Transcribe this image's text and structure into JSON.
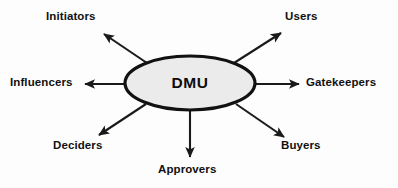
{
  "diagram": {
    "title": "DMU",
    "center": {
      "id": "dmu",
      "label": "DMU",
      "shape": "ellipse",
      "fill": "#ebebeb",
      "stroke": "#111111",
      "stroke_width": 3,
      "cx": 190,
      "cy": 83,
      "rx": 65,
      "ry": 27
    },
    "arrow_color": "#1a1a1a",
    "background": "#fdfdfd",
    "text_color": "#111111",
    "nodes": [
      {
        "id": "initiators",
        "label": "Initiators",
        "direction": "up-left",
        "line": {
          "x1": 147,
          "y1": 63,
          "x2": 104,
          "y2": 34
        }
      },
      {
        "id": "users",
        "label": "Users",
        "direction": "up-right",
        "line": {
          "x1": 234,
          "y1": 63,
          "x2": 281,
          "y2": 33
        }
      },
      {
        "id": "influencers",
        "label": "Influencers",
        "direction": "left",
        "line": {
          "x1": 126,
          "y1": 84,
          "x2": 85,
          "y2": 84
        }
      },
      {
        "id": "gatekeepers",
        "label": "Gatekeepers",
        "direction": "right",
        "line": {
          "x1": 256,
          "y1": 84,
          "x2": 299,
          "y2": 84
        }
      },
      {
        "id": "deciders",
        "label": "Deciders",
        "direction": "down-left",
        "line": {
          "x1": 146,
          "y1": 104,
          "x2": 99,
          "y2": 135
        }
      },
      {
        "id": "buyers",
        "label": "Buyers",
        "direction": "down-right",
        "line": {
          "x1": 236,
          "y1": 104,
          "x2": 284,
          "y2": 137
        }
      },
      {
        "id": "approvers",
        "label": "Approvers",
        "direction": "down",
        "line": {
          "x1": 190,
          "y1": 110,
          "x2": 190,
          "y2": 157
        }
      }
    ]
  }
}
